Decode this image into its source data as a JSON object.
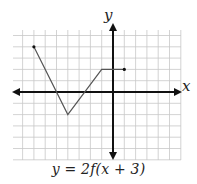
{
  "chart_data": {
    "type": "line",
    "title": "y = 2f(x + 3)",
    "xlabel": "x",
    "ylabel": "y",
    "xlim": [
      -9,
      6
    ],
    "ylim": [
      -6,
      5
    ],
    "grid": true,
    "grid_step": 1,
    "tick_labels": false,
    "series": [
      {
        "name": "y = 2f(x + 3)",
        "points": [
          [
            -7,
            4
          ],
          [
            -4,
            -2
          ],
          [
            -1,
            2
          ],
          [
            1,
            2
          ]
        ],
        "endpoints": "closed-dots"
      }
    ]
  },
  "labels": {
    "x_axis": "x",
    "y_axis": "y",
    "caption": "y = 2f(x + 3)"
  },
  "colors": {
    "grid": "#c8c8c8",
    "axis": "#111111",
    "curve": "#555555",
    "text": "#222222"
  }
}
